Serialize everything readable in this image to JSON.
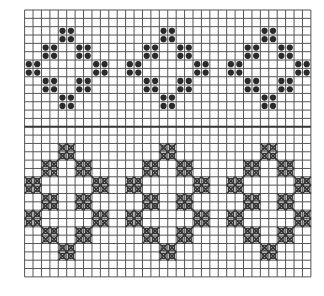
{
  "figure": {
    "grid": {
      "cols": 34,
      "rows": 32,
      "origin_x": 24.6,
      "origin_y": 10,
      "cell_w": 8.42,
      "cell_h": 8.34,
      "divider_row": 14
    },
    "colors": {
      "grid_line": "#555555",
      "divider": "#333333",
      "dot": "#2a2a2a",
      "cross": "#333333",
      "background": "#ffffff"
    },
    "motif_col_offsets": [
      0,
      12,
      24
    ],
    "upper_band": {
      "symbol": "filled-dot",
      "clusters": [
        {
          "col": 4,
          "row": 2
        },
        {
          "col": 2,
          "row": 4
        },
        {
          "col": 6,
          "row": 4
        },
        {
          "col": 0,
          "row": 6
        },
        {
          "col": 8,
          "row": 6
        },
        {
          "col": 2,
          "row": 8
        },
        {
          "col": 6,
          "row": 8
        },
        {
          "col": 4,
          "row": 10
        }
      ]
    },
    "lower_band": {
      "symbol": "crossed-circle",
      "clusters": [
        {
          "col": 4,
          "row": 16
        },
        {
          "col": 2,
          "row": 18
        },
        {
          "col": 6,
          "row": 18
        },
        {
          "col": 0,
          "row": 20
        },
        {
          "col": 8,
          "row": 20
        },
        {
          "col": 2,
          "row": 22
        },
        {
          "col": 6,
          "row": 22
        },
        {
          "col": 0,
          "row": 24
        },
        {
          "col": 8,
          "row": 24
        },
        {
          "col": 2,
          "row": 26
        },
        {
          "col": 6,
          "row": 26
        },
        {
          "col": 4,
          "row": 28
        }
      ]
    }
  }
}
